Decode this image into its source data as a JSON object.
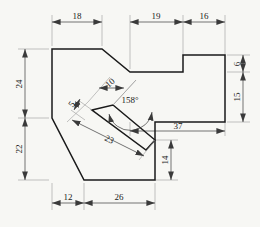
{
  "drawing": {
    "title": "Orthographic outline with angled slot",
    "background_color": "#f7f7f4",
    "outline_color": "#1a1a1a",
    "dimension_color": "#4a4a4a",
    "text_color": "#1a1a1a"
  },
  "dimensions": {
    "top_left_width": "18",
    "top_mid_width": "19",
    "top_right_width": "16",
    "left_upper_height": "24",
    "left_lower_height": "22",
    "bottom_left_width": "12",
    "bottom_mid_width": "26",
    "right_step_height": "6",
    "right_lower_height": "15",
    "lower_span_width": "37",
    "right_tab_height": "14",
    "slot_width": "10",
    "slot_thickness": "5",
    "slot_length": "23",
    "slot_angle": "158°"
  }
}
